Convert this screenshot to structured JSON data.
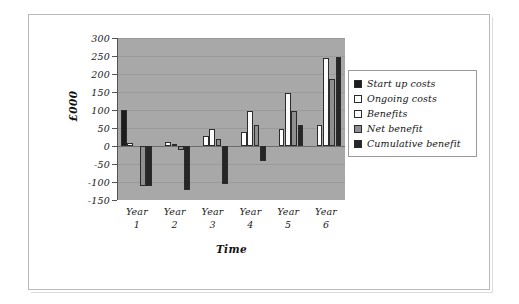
{
  "chart_data": {
    "type": "bar",
    "title": "",
    "subtitle": "",
    "xlabel": "Time",
    "ylabel": "£000",
    "categories": [
      "Year 1",
      "Year 2",
      "Year 3",
      "Year 4",
      "Year 5",
      "Year 6"
    ],
    "category_lines": [
      {
        "line1": "Year",
        "line2": "1"
      },
      {
        "line1": "Year",
        "line2": "2"
      },
      {
        "line1": "Year",
        "line2": "3"
      },
      {
        "line1": "Year",
        "line2": "4"
      },
      {
        "line1": "Year",
        "line2": "5"
      },
      {
        "line1": "Year",
        "line2": "6"
      }
    ],
    "ylim": [
      -150,
      300
    ],
    "ytick_step": 50,
    "yticks": [
      300,
      250,
      200,
      150,
      100,
      50,
      0,
      -50,
      -100,
      -150
    ],
    "ytick_labels": [
      "300",
      "250",
      "200",
      "150",
      "100",
      "50",
      "0",
      "-50",
      "-100",
      "-150"
    ],
    "grid": true,
    "legend_position": "right",
    "series": [
      {
        "name": "Start up costs",
        "color": "#1c1c1c",
        "values": [
          100,
          0,
          0,
          0,
          0,
          0
        ]
      },
      {
        "name": "Ongoing costs",
        "color": "#ffffff",
        "values": [
          8,
          12,
          28,
          38,
          48,
          58
        ]
      },
      {
        "name": "Benefits",
        "color": "#fbfbfb",
        "values": [
          0,
          5,
          48,
          97,
          147,
          245
        ]
      },
      {
        "name": "Net benefit",
        "color": "#8f8f8f",
        "values": [
          -110,
          -10,
          20,
          58,
          97,
          185
        ]
      },
      {
        "name": "Cumulative benefit",
        "color": "#262626",
        "values": [
          -110,
          -122,
          -105,
          -42,
          58,
          247
        ]
      }
    ]
  },
  "legend": {
    "items": [
      {
        "label": "Start up costs"
      },
      {
        "label": "Ongoing costs"
      },
      {
        "label": "Benefits"
      },
      {
        "label": "Net benefit"
      },
      {
        "label": "Cumulative benefit"
      }
    ]
  },
  "axes": {
    "y_title": "£000",
    "x_title": "Time"
  },
  "colors": {
    "plot_background": "#a8a8a8",
    "page_background": "#ffffff",
    "gridline": "#9a9a9a",
    "axis": "#555555",
    "bar_outline": "#2b2b2b"
  }
}
